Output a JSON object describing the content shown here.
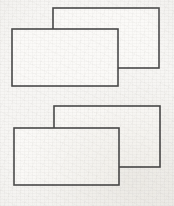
{
  "figure": {
    "canvas": {
      "width": 174,
      "height": 206
    },
    "style": {
      "background_color": "#f7f6f4",
      "paper_tint": "#eceae6",
      "line_color": "#4a4a4a",
      "line_color_dark": "#3c3c3c",
      "fill_color": "#fbfaf8",
      "line_width": 1.6
    },
    "groups": [
      {
        "name": "top-pair",
        "label": "Upper overlapping rectangle pair",
        "shapes": [
          {
            "name": "top-back-rectangle",
            "label": "Upper rear rectangle",
            "depth": "back",
            "occluded": true,
            "x": 53,
            "y": 8,
            "width": 106,
            "height": 60,
            "x2": 159,
            "y2": 68
          },
          {
            "name": "top-front-rectangle",
            "label": "Upper front rectangle",
            "depth": "front",
            "occluded": false,
            "x": 12,
            "y": 29,
            "width": 106,
            "height": 57,
            "x2": 118,
            "y2": 86
          }
        ],
        "overlap": {
          "x": 53,
          "y": 29,
          "x2": 118,
          "y2": 68
        }
      },
      {
        "name": "bottom-pair",
        "label": "Lower overlapping rectangle pair",
        "shapes": [
          {
            "name": "bottom-back-rectangle",
            "label": "Lower rear rectangle",
            "depth": "back",
            "occluded": true,
            "x": 54,
            "y": 106,
            "width": 106,
            "height": 61,
            "x2": 160,
            "y2": 167
          },
          {
            "name": "bottom-front-rectangle",
            "label": "Lower front rectangle",
            "depth": "front",
            "occluded": false,
            "x": 14,
            "y": 128,
            "width": 105,
            "height": 57,
            "x2": 119,
            "y2": 185
          }
        ],
        "overlap": {
          "x": 54,
          "y": 128,
          "x2": 119,
          "y2": 167
        }
      }
    ]
  }
}
